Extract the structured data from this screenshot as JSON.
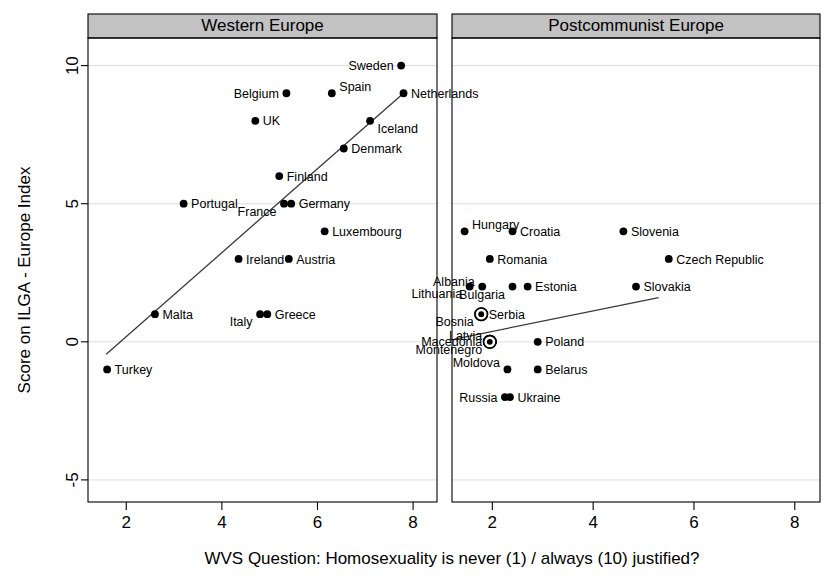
{
  "chart_data": {
    "type": "scatter",
    "title": "",
    "xlabel": "WVS Question: Homosexuality is never (1) / always (10) justified?",
    "ylabel": "Score on ILGA - Europe Index",
    "xlim": [
      1.2,
      8.5
    ],
    "ylim": [
      -5.8,
      11.0
    ],
    "xticks": [
      2,
      4,
      6,
      8
    ],
    "yticks": [
      -5,
      0,
      5,
      10
    ],
    "xtick_labels": [
      "2",
      "4",
      "6",
      "8"
    ],
    "ytick_labels": [
      "-5",
      "0",
      "5",
      "10"
    ],
    "grid": true,
    "grid_axis": "y",
    "legend": "none",
    "panels": [
      {
        "name": "western-europe",
        "title": "Western Europe",
        "points": [
          {
            "label": "Sweden",
            "x": 7.75,
            "y": 10.0,
            "label_side": "left",
            "marker": "dot"
          },
          {
            "label": "Spain",
            "x": 6.3,
            "y": 9.0,
            "label_side": "right",
            "label_dy": -0.55,
            "marker": "dot"
          },
          {
            "label": "Belgium",
            "x": 5.35,
            "y": 9.0,
            "label_side": "left",
            "marker": "dot"
          },
          {
            "label": "Netherlands",
            "x": 7.8,
            "y": 9.0,
            "label_side": "right",
            "marker": "dot"
          },
          {
            "label": "UK",
            "x": 4.7,
            "y": 8.0,
            "label_side": "right",
            "marker": "dot"
          },
          {
            "label": "Iceland",
            "x": 7.1,
            "y": 8.0,
            "label_side": "right",
            "label_dy": 0.6,
            "marker": "dot"
          },
          {
            "label": "Denmark",
            "x": 6.55,
            "y": 7.0,
            "label_side": "right",
            "marker": "dot"
          },
          {
            "label": "Finland",
            "x": 5.2,
            "y": 6.0,
            "label_side": "right",
            "marker": "dot"
          },
          {
            "label": "Portugal",
            "x": 3.2,
            "y": 5.0,
            "label_side": "right",
            "marker": "dot"
          },
          {
            "label": "France",
            "x": 5.3,
            "y": 5.0,
            "label_side": "left",
            "label_dy": 0.62,
            "marker": "dot"
          },
          {
            "label": "Germany",
            "x": 5.45,
            "y": 5.0,
            "label_side": "right",
            "marker": "dot"
          },
          {
            "label": "Luxembourg",
            "x": 6.15,
            "y": 4.0,
            "label_side": "right",
            "marker": "dot"
          },
          {
            "label": "Ireland",
            "x": 4.35,
            "y": 3.0,
            "label_side": "right",
            "marker": "dot"
          },
          {
            "label": "Austria",
            "x": 5.4,
            "y": 3.0,
            "label_side": "right",
            "marker": "dot"
          },
          {
            "label": "Malta",
            "x": 2.6,
            "y": 1.0,
            "label_side": "right",
            "marker": "dot"
          },
          {
            "label": "Italy",
            "x": 4.8,
            "y": 1.0,
            "label_side": "left",
            "label_dy": 0.62,
            "marker": "dot"
          },
          {
            "label": "Greece",
            "x": 4.95,
            "y": 1.0,
            "label_side": "right",
            "marker": "dot"
          },
          {
            "label": "Turkey",
            "x": 1.6,
            "y": -1.0,
            "label_side": "right",
            "marker": "dot"
          }
        ],
        "fit_line": {
          "x1": 1.58,
          "y1": -0.45,
          "x2": 7.8,
          "y2": 9.0
        }
      },
      {
        "name": "postcommunist-europe",
        "title": "Postcommunist Europe",
        "points": [
          {
            "label": "Hungary",
            "x": 1.45,
            "y": 4.0,
            "label_side": "right",
            "label_dy": -0.55,
            "marker": "dot"
          },
          {
            "label": "Croatia",
            "x": 2.4,
            "y": 4.0,
            "label_side": "right",
            "marker": "dot"
          },
          {
            "label": "Slovenia",
            "x": 4.6,
            "y": 4.0,
            "label_side": "right",
            "marker": "dot"
          },
          {
            "label": "Romania",
            "x": 1.95,
            "y": 3.0,
            "label_side": "right",
            "marker": "dot"
          },
          {
            "label": "Czech Republic",
            "x": 5.5,
            "y": 3.0,
            "label_side": "right",
            "marker": "dot"
          },
          {
            "label": "Lithuania",
            "x": 1.55,
            "y": 2.0,
            "label_side": "left",
            "label_dy": 0.6,
            "marker": "dot"
          },
          {
            "label": "Bulgaria",
            "x": 2.4,
            "y": 2.0,
            "label_side": "left",
            "label_dy": 0.62,
            "marker": "dot"
          },
          {
            "label": "Estonia",
            "x": 2.7,
            "y": 2.0,
            "label_side": "right",
            "marker": "dot"
          },
          {
            "label": "Slovakia",
            "x": 4.85,
            "y": 2.0,
            "label_side": "right",
            "marker": "dot"
          },
          {
            "label": "Albania",
            "x": 1.8,
            "y": 2.0,
            "label_side": "left",
            "label_dy": -0.42,
            "marker": "dot"
          },
          {
            "label": "Bosnia",
            "x": 1.78,
            "y": 1.0,
            "label_side": "left",
            "label_dy": 0.6,
            "marker": "ring"
          },
          {
            "label": "Serbia",
            "x": 1.78,
            "y": 1.0,
            "label_side": "right",
            "marker": "ring"
          },
          {
            "label": "Montenegro",
            "x": 1.95,
            "y": 0.0,
            "label_side": "left",
            "label_dy": 0.62,
            "marker": "ring"
          },
          {
            "label": "Macedonia",
            "x": 1.95,
            "y": 0.0,
            "label_side": "left",
            "marker": "ring"
          },
          {
            "label": "Latvia",
            "x": 1.95,
            "y": 0.0,
            "label_side": "left",
            "label_dy": -0.55,
            "marker": "ring"
          },
          {
            "label": "Poland",
            "x": 2.9,
            "y": 0.0,
            "label_side": "right",
            "marker": "dot"
          },
          {
            "label": "Moldova",
            "x": 2.3,
            "y": -1.0,
            "label_side": "left",
            "label_dy": -0.6,
            "marker": "dot"
          },
          {
            "label": "Belarus",
            "x": 2.9,
            "y": -1.0,
            "label_side": "right",
            "marker": "dot"
          },
          {
            "label": "Russia",
            "x": 2.25,
            "y": -2.0,
            "label_side": "left",
            "marker": "dot"
          },
          {
            "label": "Ukraine",
            "x": 2.35,
            "y": -2.0,
            "label_side": "right",
            "marker": "dot"
          }
        ],
        "fit_line": {
          "x1": 1.25,
          "y1": 0.1,
          "x2": 5.3,
          "y2": 1.6
        }
      }
    ]
  },
  "colors": {
    "header_fill": "#c2c2c2",
    "marker": "#000000",
    "fit_line": "#3a3a3a",
    "grid": "#d8d8d8",
    "axis": "#000000",
    "background": "#ffffff"
  }
}
